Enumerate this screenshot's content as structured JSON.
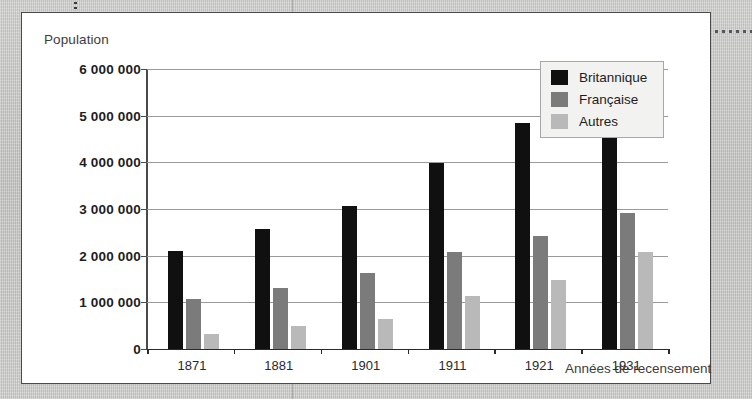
{
  "figure": {
    "y_axis_title": "Population",
    "x_axis_title": "Années de recensement"
  },
  "legend": {
    "entries": [
      {
        "label": "Britannique",
        "color": "#101010",
        "key": "britannique"
      },
      {
        "label": "Française",
        "color": "#7b7b7b",
        "key": "francaise"
      },
      {
        "label": "Autres",
        "color": "#b9b9b9",
        "key": "autres"
      }
    ]
  },
  "y_ticks": [
    {
      "label": "6 000 000",
      "value": 6000000
    },
    {
      "label": "5 000 000",
      "value": 5000000
    },
    {
      "label": "4 000 000",
      "value": 4000000
    },
    {
      "label": "3 000 000",
      "value": 3000000
    },
    {
      "label": "2 000 000",
      "value": 2000000
    },
    {
      "label": "1 000 000",
      "value": 1000000
    },
    {
      "label": "0",
      "value": 0
    }
  ],
  "chart_data": {
    "type": "bar",
    "title": "",
    "subtitle": "",
    "xlabel": "Années de recensement",
    "ylabel": "Population",
    "categories": [
      "1871",
      "1881",
      "1901",
      "1911",
      "1921",
      "1931"
    ],
    "series": [
      {
        "name": "Britannique",
        "color": "#101010",
        "values": [
          2110000,
          2570000,
          3070000,
          3980000,
          4850000,
          5370000
        ]
      },
      {
        "name": "Française",
        "color": "#7b7b7b",
        "values": [
          1080000,
          1300000,
          1630000,
          2070000,
          2420000,
          2920000
        ]
      },
      {
        "name": "Autres",
        "color": "#b9b9b9",
        "values": [
          330000,
          490000,
          650000,
          1140000,
          1470000,
          2070000
        ]
      }
    ],
    "ylim": [
      0,
      6000000
    ],
    "ytick_values": [
      0,
      1000000,
      2000000,
      3000000,
      4000000,
      5000000,
      6000000
    ],
    "ytick_labels": [
      "0",
      "1 000 000",
      "2 000 000",
      "3 000 000",
      "4 000 000",
      "5 000 000",
      "6 000 000"
    ],
    "grid": true,
    "grid_axis": "y",
    "legend_position": "top-right"
  }
}
